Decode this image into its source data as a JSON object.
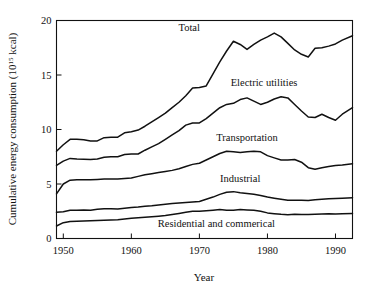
{
  "chart_data": {
    "type": "line",
    "title": "",
    "xlabel": "Year",
    "ylabel": "Cumulative energy consumption (10",
    "ylabel_sup": "15",
    "ylabel_tail": " kcal)",
    "xlim": [
      1949,
      1992.5
    ],
    "ylim": [
      0,
      20
    ],
    "xticks": [
      1950,
      1960,
      1970,
      1980,
      1990
    ],
    "xtick_labels": [
      "1950",
      "1960",
      "1970",
      "1980",
      "1990"
    ],
    "yticks": [
      0,
      5,
      10,
      15,
      20
    ],
    "ytick_labels": [
      "0",
      "5",
      "10",
      "15",
      "20"
    ],
    "grid": false,
    "legend": "inline-labels",
    "stacked": true,
    "x": [
      1949,
      1950,
      1951,
      1952,
      1953,
      1954,
      1955,
      1956,
      1957,
      1958,
      1959,
      1960,
      1961,
      1962,
      1963,
      1964,
      1965,
      1966,
      1967,
      1968,
      1969,
      1970,
      1971,
      1972,
      1973,
      1974,
      1975,
      1976,
      1977,
      1978,
      1979,
      1980,
      1981,
      1982,
      1983,
      1984,
      1985,
      1986,
      1987,
      1988,
      1989,
      1990,
      1991,
      1992.5
    ],
    "series": [
      {
        "name": "Residential and commerical",
        "label": "Residential and commerical",
        "label_x": 1972.5,
        "label_y": 1.05,
        "values": [
          1.15,
          1.45,
          1.55,
          1.58,
          1.6,
          1.62,
          1.65,
          1.68,
          1.7,
          1.72,
          1.78,
          1.85,
          1.9,
          1.95,
          2.0,
          2.05,
          2.1,
          2.2,
          2.3,
          2.4,
          2.5,
          2.5,
          2.55,
          2.6,
          2.65,
          2.6,
          2.6,
          2.65,
          2.62,
          2.6,
          2.5,
          2.35,
          2.28,
          2.22,
          2.18,
          2.22,
          2.2,
          2.2,
          2.22,
          2.25,
          2.26,
          2.25,
          2.28,
          2.3
        ]
      },
      {
        "name": "Industrial",
        "label": "Industrial",
        "label_x": 1976.0,
        "label_y": 5.15,
        "values": [
          2.4,
          2.45,
          2.6,
          2.6,
          2.62,
          2.6,
          2.68,
          2.72,
          2.72,
          2.7,
          2.78,
          2.85,
          2.88,
          2.95,
          3.0,
          3.08,
          3.15,
          3.2,
          3.25,
          3.3,
          3.35,
          3.4,
          3.6,
          3.8,
          4.05,
          4.25,
          4.3,
          4.2,
          4.12,
          4.05,
          3.95,
          3.8,
          3.7,
          3.6,
          3.5,
          3.5,
          3.5,
          3.48,
          3.55,
          3.6,
          3.65,
          3.68,
          3.7,
          3.75
        ]
      },
      {
        "name": "Transportation",
        "label": "Transportation",
        "label_x": 1977.0,
        "label_y": 8.9,
        "values": [
          4.1,
          5.0,
          5.35,
          5.38,
          5.38,
          5.38,
          5.42,
          5.45,
          5.45,
          5.45,
          5.5,
          5.55,
          5.7,
          5.85,
          5.95,
          6.05,
          6.15,
          6.25,
          6.4,
          6.6,
          6.8,
          6.9,
          7.2,
          7.5,
          7.8,
          8.0,
          7.95,
          7.9,
          7.95,
          8.0,
          7.95,
          7.6,
          7.4,
          7.2,
          7.2,
          7.25,
          7.0,
          6.5,
          6.35,
          6.5,
          6.6,
          6.7,
          6.75,
          6.85
        ]
      },
      {
        "name": "Electric utilities",
        "label": "Electric utilities",
        "label_x": 1979.5,
        "label_y": 14.0,
        "values": [
          6.7,
          7.1,
          7.35,
          7.3,
          7.28,
          7.25,
          7.3,
          7.45,
          7.5,
          7.5,
          7.7,
          7.75,
          7.75,
          8.1,
          8.4,
          8.7,
          9.1,
          9.5,
          9.9,
          10.4,
          10.6,
          10.6,
          11.0,
          11.5,
          12.0,
          12.3,
          12.4,
          12.75,
          12.9,
          12.6,
          12.3,
          12.5,
          12.8,
          13.0,
          12.9,
          12.3,
          11.7,
          11.15,
          11.1,
          11.4,
          11.1,
          10.85,
          11.4,
          12.0
        ]
      },
      {
        "name": "Total",
        "label": "Total",
        "label_x": 1968.5,
        "label_y": 19.0,
        "values": [
          8.0,
          8.6,
          9.1,
          9.1,
          9.05,
          8.95,
          8.95,
          9.25,
          9.3,
          9.3,
          9.7,
          9.8,
          9.95,
          10.3,
          10.7,
          11.1,
          11.5,
          12.0,
          12.5,
          13.1,
          13.8,
          13.85,
          14.0,
          15.1,
          16.2,
          17.2,
          18.1,
          17.8,
          17.35,
          17.8,
          18.2,
          18.5,
          18.85,
          18.5,
          17.9,
          17.3,
          16.9,
          16.65,
          17.45,
          17.5,
          17.65,
          17.85,
          18.2,
          18.6
        ]
      }
    ],
    "series_order_note": "stacked cumulative curves drawn bottom to top"
  },
  "figure": {
    "background_color": "#ffffff",
    "line_color": "#111111",
    "axis_color": "#111111"
  }
}
